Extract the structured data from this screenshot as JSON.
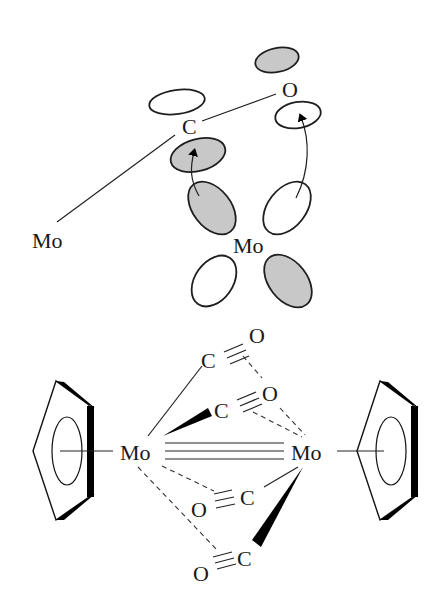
{
  "figure": {
    "top_panel": {
      "description": "Orbital interaction diagram: Mo d-orbitals donating into C and O of a bridging CO (pi back-bonding to a semi-bridging carbonyl)",
      "labels": {
        "mo_left": "Mo",
        "carbon": "C",
        "oxygen": "O",
        "mo_center": "Mo"
      },
      "lobe_fill_shaded": "#c8c8c8",
      "lobe_fill_open": "#ffffff"
    },
    "bottom_panel": {
      "description": "Cp2Mo2(CO)4 structure with Mo≡Mo triple bond and semi-bridging carbonyls",
      "labels": {
        "mo_left": "Mo",
        "mo_right": "Mo",
        "co1_c": "C",
        "co1_o": "O",
        "co2_c": "C",
        "co2_o": "O",
        "co3_c": "C",
        "co3_o": "O",
        "co4_c": "C",
        "co4_o": "O"
      },
      "bond_mo_mo": "triple"
    }
  }
}
